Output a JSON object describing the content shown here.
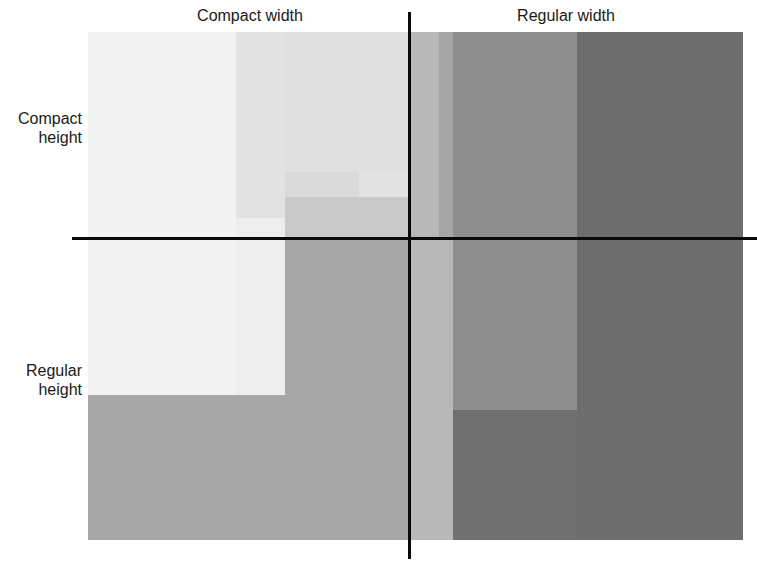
{
  "diagram": {
    "column_labels": {
      "compact_width": "Compact width",
      "regular_width": "Regular width"
    },
    "row_labels": {
      "compact_height_line1": "Compact",
      "compact_height_line2": "height",
      "regular_height_line1": "Regular",
      "regular_height_line2": "height"
    },
    "regions": [
      {
        "name": "compact-width-base",
        "color": "#a7a7a7"
      },
      {
        "name": "compact-width-compact-height-light",
        "color": "#f1f1f1"
      },
      {
        "name": "compact-width-mid-band",
        "color": "#e4e4e4"
      },
      {
        "name": "compact-width-inner-band",
        "color": "#d7d7d7"
      },
      {
        "name": "center-strip",
        "color": "#b7b7b7"
      },
      {
        "name": "regular-width-base",
        "color": "#727272"
      },
      {
        "name": "regular-width-mid",
        "color": "#8f8f8f"
      },
      {
        "name": "regular-width-dark",
        "color": "#6d6d6d"
      }
    ],
    "axis_color": "#0a0a0a"
  }
}
